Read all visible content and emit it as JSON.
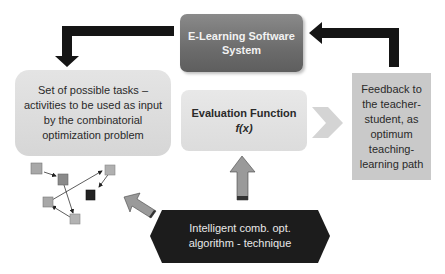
{
  "diagram": {
    "title": "",
    "nodes": {
      "elearning": {
        "line1": "E-Learning Software",
        "line2": "System"
      },
      "evaluation": {
        "line1": "Evaluation Function",
        "line2": "f(x)"
      },
      "tasks": {
        "text": "Set of possible tasks – activities to be used as input by the combinatorial optimization problem"
      },
      "feedback": {
        "text": "Feedback to the teacher-student, as optimum teaching-learning path"
      },
      "algorithm": {
        "line1": "Intelligent comb. opt.",
        "line2": "algorithm - technique"
      }
    },
    "edges": [
      {
        "from": "elearning",
        "to": "tasks",
        "style": "thick-black-elbow-arrow"
      },
      {
        "from": "feedback",
        "to": "elearning",
        "style": "thick-black-elbow-arrow"
      },
      {
        "from": "algorithm",
        "to": "evaluation",
        "style": "gray-block-arrow-up"
      },
      {
        "from": "algorithm",
        "to": "task-graph",
        "style": "gray-block-arrow-diagonal"
      },
      {
        "from": "evaluation",
        "to": "feedback",
        "style": "light-gray-chevron"
      }
    ],
    "colors": {
      "elearning_fill": "#6c6c6c",
      "evaluation_fill": "#e0e0e0",
      "tasks_fill": "#dcdcdc",
      "feedback_fill": "#c9c9c9",
      "algorithm_fill": "#1c1c1c",
      "arrow_black": "#151515",
      "arrow_gray": "#999999"
    }
  }
}
